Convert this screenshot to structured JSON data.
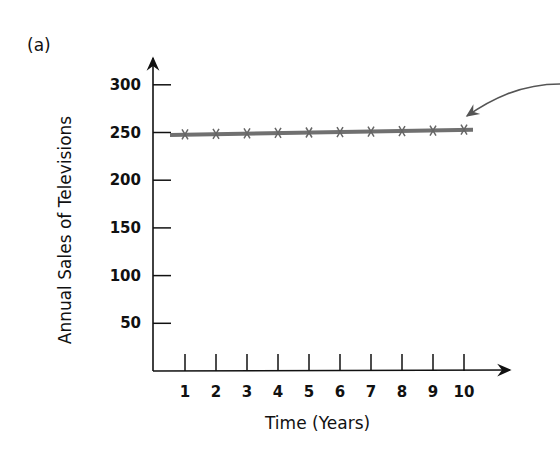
{
  "panel_label": "(a)",
  "chart_data": {
    "type": "line",
    "title": "",
    "xlabel": "Time (Years)",
    "ylabel": "Annual Sales of Televisions",
    "x": [
      1,
      2,
      3,
      4,
      5,
      6,
      7,
      8,
      9,
      10
    ],
    "series": [
      {
        "name": "Annual Sales",
        "values": [
          248,
          248.5,
          249,
          249.5,
          250,
          250.5,
          251,
          251.5,
          252,
          253
        ]
      }
    ],
    "x_ticks": [
      "1",
      "2",
      "3",
      "4",
      "5",
      "6",
      "7",
      "8",
      "9",
      "10"
    ],
    "y_ticks": [
      "50",
      "100",
      "150",
      "200",
      "250",
      "300"
    ],
    "xlim": [
      0,
      11
    ],
    "ylim": [
      0,
      350
    ],
    "grid": false,
    "legend": null,
    "annotations": [
      {
        "type": "curved-arrow",
        "points_to": "line end near year 10"
      }
    ],
    "colors": {
      "line": "#707070",
      "axes": "#111111"
    }
  }
}
